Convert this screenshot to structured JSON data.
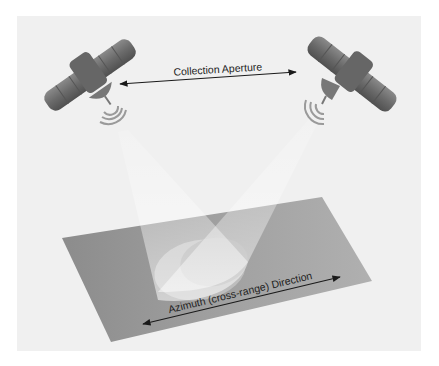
{
  "diagram": {
    "labels": {
      "collection_aperture": "Collection Aperture",
      "azimuth_direction": "Azimuth (cross-range) Direction"
    },
    "elements": {
      "satellites": [
        {
          "id": "satellite-left",
          "position": "left",
          "emitting": true
        },
        {
          "id": "satellite-right",
          "position": "right",
          "emitting": true
        }
      ],
      "beams": [
        {
          "from": "satellite-left",
          "to": "ground-footprint"
        },
        {
          "from": "satellite-right",
          "to": "ground-footprint"
        }
      ],
      "ground_plane": "ground-plane",
      "footprint": "ground-footprint",
      "arrows": [
        {
          "id": "collection-aperture-arrow",
          "between": [
            "satellite-left",
            "satellite-right"
          ],
          "double_headed": true
        },
        {
          "id": "azimuth-arrow",
          "along": "ground-plane",
          "double_headed": true
        }
      ]
    },
    "colors": {
      "page_background": "#ffffff",
      "panel_background": "#f0f0f0",
      "plane": "#9a9a9a",
      "satellite": "#6e6e6e",
      "beam": "#ffffff",
      "arrow": "#1a1a1a",
      "text": "#222222"
    }
  }
}
